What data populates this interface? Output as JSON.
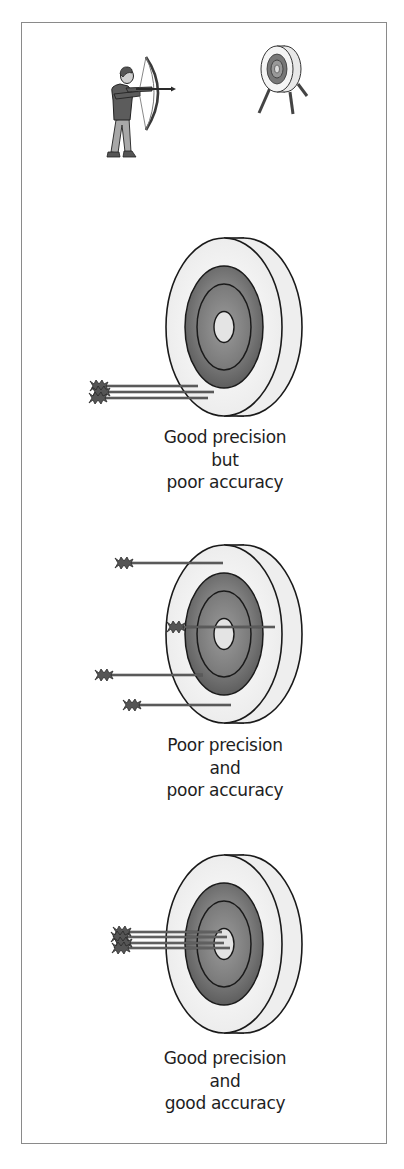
{
  "figure": {
    "scene": {
      "archer_icon": "archer-aiming-bow",
      "stand_target_icon": "target-on-stand"
    },
    "panels": [
      {
        "id": "good-precision-poor-accuracy",
        "caption_lines": [
          "Good precision",
          "but",
          "poor accuracy"
        ],
        "arrow_count": 3,
        "grouping": "tight cluster, off-center (lower left of target)"
      },
      {
        "id": "poor-precision-poor-accuracy",
        "caption_lines": [
          "Poor precision",
          "and",
          "poor accuracy"
        ],
        "arrow_count": 4,
        "grouping": "scattered across target"
      },
      {
        "id": "good-precision-good-accuracy",
        "caption_lines": [
          "Good precision",
          "and",
          "good accuracy"
        ],
        "arrow_count": 4,
        "grouping": "tight cluster in bullseye"
      }
    ]
  },
  "colors": {
    "frame_border": "#8a8a8a",
    "target_face": "#f2f2f2",
    "target_ring_dark": "#6e6e6e",
    "target_ring_mid": "#8c8c8c",
    "bullseye": "#e6e6e6",
    "outline": "#1a1a1a",
    "arrow": "#4a4a4a",
    "text": "#1e1e1e"
  }
}
